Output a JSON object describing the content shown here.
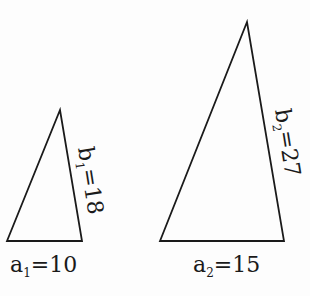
{
  "diagram": {
    "triangles": [
      {
        "id": "triangle-1",
        "base_label": "a",
        "base_sub": "1",
        "base_value": "=10",
        "side_label": "b",
        "side_sub": "1",
        "side_value": "=18"
      },
      {
        "id": "triangle-2",
        "base_label": "a",
        "base_sub": "2",
        "base_value": "=15",
        "side_label": "b",
        "side_sub": "2",
        "side_value": "=27"
      }
    ],
    "stroke_color": "#1a1a1a",
    "background": "#fdfdfd"
  }
}
